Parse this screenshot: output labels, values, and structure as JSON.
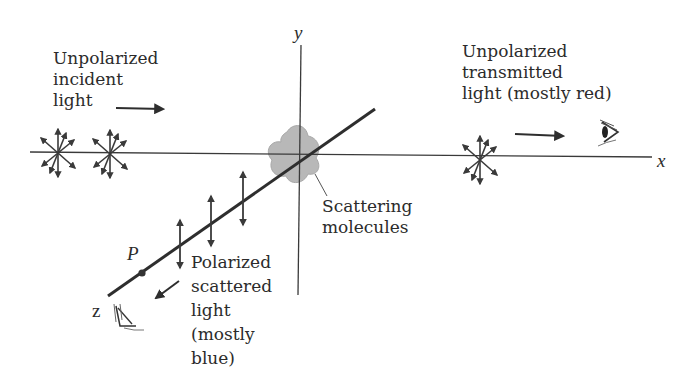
{
  "diagram": {
    "axes": {
      "x_label": "x",
      "y_label": "y",
      "z_label": "z"
    },
    "labels": {
      "incident": [
        "Unpolarized",
        "incident",
        "light"
      ],
      "transmitted": [
        "Unpolarized",
        "transmitted",
        "light (mostly red)"
      ],
      "scatterers": [
        "Scattering",
        "molecules"
      ],
      "scattered": [
        "Polarized",
        "scattered",
        "light",
        "(mostly",
        "blue)"
      ],
      "point": "P"
    },
    "icons": [
      "unpolarized-light-symbol",
      "unpolarized-light-symbol",
      "unpolarized-light-symbol",
      "eye-icon-x-axis",
      "eye-icon-z-axis",
      "polarized-vertical-arrows",
      "scattering-molecule-cloud"
    ],
    "colors": {
      "line": "#2e2e2e",
      "cloud": "#b5b5b5",
      "text": "#2b2b2b"
    }
  }
}
